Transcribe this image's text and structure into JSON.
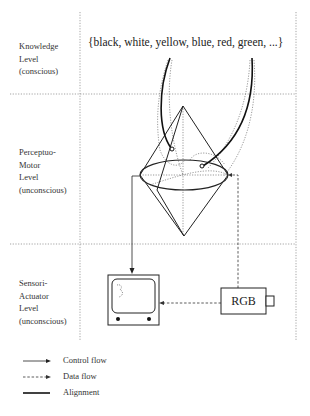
{
  "levels": [
    {
      "name": "knowledge-level",
      "lines": [
        "Knowledge",
        "Level",
        "(conscious)"
      ]
    },
    {
      "name": "perceptuo-motor-level",
      "lines": [
        "Perceptuo-",
        "Motor",
        "Level",
        "(unconscious)"
      ]
    },
    {
      "name": "sensori-actuator-level",
      "lines": [
        "Sensori-",
        "Actuator",
        "Level",
        "(unconscious)"
      ]
    }
  ],
  "color_set": "{black, white, yellow, blue, red, green, ...}",
  "camera_label": "RGB",
  "legend": [
    {
      "label": "Control flow",
      "style": "arrow-solid"
    },
    {
      "label": "Data flow",
      "style": "arrow-dashed"
    },
    {
      "label": "Alignment",
      "style": "thick-solid"
    }
  ]
}
